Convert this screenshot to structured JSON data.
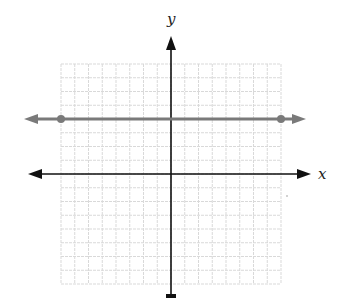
{
  "chart_data": {
    "type": "line",
    "title": "",
    "xlabel": "x",
    "ylabel": "y",
    "xlim": [
      -8,
      8
    ],
    "ylim": [
      -8,
      8
    ],
    "grid": true,
    "grid_step": 1,
    "series": [
      {
        "name": "y = 4",
        "equation": "y = 4",
        "x": [
          -8,
          8
        ],
        "y": [
          4,
          4
        ],
        "points": [
          [
            -8,
            4
          ],
          [
            8,
            4
          ]
        ],
        "extends_both_directions": true,
        "color": "#7a7a7a"
      }
    ]
  },
  "colors": {
    "grid": "#d9d9d9",
    "axes": "#111111",
    "line": "#7a7a7a"
  },
  "labels": {
    "x_axis": "x",
    "y_axis": "y"
  }
}
